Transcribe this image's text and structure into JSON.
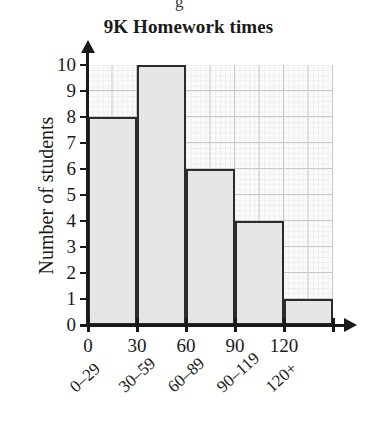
{
  "page": {
    "top_fragment": "g"
  },
  "chart_data": {
    "type": "bar",
    "title": "9K Homework times",
    "xlabel": "",
    "ylabel": "Number of students",
    "categories": [
      "0–29",
      "30–59",
      "60–89",
      "90–119",
      "120+"
    ],
    "values": [
      8,
      10,
      6,
      4,
      1
    ],
    "ylim": [
      0,
      10
    ],
    "ytick_labels": [
      "0",
      "1",
      "2",
      "3",
      "4",
      "5",
      "6",
      "7",
      "8",
      "9",
      "10"
    ],
    "xtick_labels": [
      "0",
      "30",
      "60",
      "90",
      "120"
    ],
    "xtick_positions": [
      0,
      30,
      60,
      90,
      120
    ],
    "xlim": [
      0,
      150
    ],
    "grid": true,
    "legend": false,
    "bar_fill_color": "#e6e6e6",
    "bar_edge_color": "#2b2b2b",
    "grid_color": "#c9c9c9",
    "axis_color": "#1a1a1a"
  }
}
